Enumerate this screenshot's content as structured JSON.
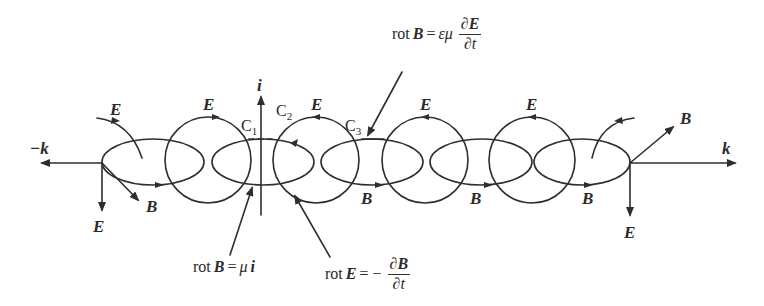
{
  "diagram": {
    "axes": {
      "negative_k": "−k",
      "positive_k": "k",
      "current": "i"
    },
    "field_labels": {
      "E": "E",
      "B": "B"
    },
    "loop_labels": {
      "c1": "C",
      "c1_sub": "1",
      "c2": "C",
      "c2_sub": "2",
      "c3": "C",
      "c3_sub": "3"
    },
    "equations": {
      "top": {
        "lhs": "rot",
        "vec": "B",
        "eq": "=",
        "coef": "εμ",
        "num": "∂E",
        "den": "∂t"
      },
      "bottom_left": {
        "lhs": "rot",
        "vec": "B",
        "eq": "=",
        "coef": "μ",
        "rhs_vec": "i"
      },
      "bottom_right": {
        "lhs": "rot",
        "vec": "E",
        "eq": "= −",
        "num": "∂B",
        "den": "∂t"
      }
    },
    "colors": {
      "line": "#2e2e2e",
      "background": "#ffffff"
    }
  }
}
